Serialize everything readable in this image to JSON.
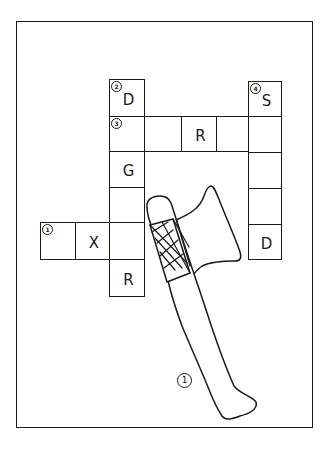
{
  "puzzle": {
    "type": "crossword",
    "clues": [
      {
        "number": "1",
        "direction": "across",
        "length": 3,
        "known_letters": [
          "",
          "X",
          ""
        ],
        "picture_hint": "axe"
      },
      {
        "number": "2",
        "direction": "down",
        "length": 6,
        "known_letters": [
          "D",
          "",
          "G",
          "",
          "",
          "R"
        ]
      },
      {
        "number": "3",
        "direction": "across",
        "length": 5,
        "known_letters": [
          "",
          "",
          "R",
          "",
          ""
        ]
      },
      {
        "number": "4",
        "direction": "down",
        "length": 5,
        "known_letters": [
          "S",
          "",
          "",
          "",
          "D"
        ]
      }
    ],
    "cells": [
      {
        "id": "c-2-1",
        "x": 109,
        "y": 79,
        "w": 36,
        "h": 38,
        "letter": "D",
        "number": "2"
      },
      {
        "id": "c-3-1",
        "x": 109,
        "y": 116,
        "w": 36,
        "h": 36,
        "letter": "",
        "number": "3"
      },
      {
        "id": "c-3-2",
        "x": 144,
        "y": 116,
        "w": 38,
        "h": 36,
        "letter": "",
        "number": ""
      },
      {
        "id": "c-3-3",
        "x": 181,
        "y": 116,
        "w": 36,
        "h": 36,
        "letter": "R",
        "number": ""
      },
      {
        "id": "c-3-4",
        "x": 216,
        "y": 116,
        "w": 33,
        "h": 36,
        "letter": "",
        "number": ""
      },
      {
        "id": "c-4-1",
        "x": 248,
        "y": 81,
        "w": 34,
        "h": 36,
        "letter": "S",
        "number": "4"
      },
      {
        "id": "c-3-5",
        "x": 248,
        "y": 116,
        "w": 34,
        "h": 37,
        "letter": "",
        "number": ""
      },
      {
        "id": "c-4-3",
        "x": 248,
        "y": 152,
        "w": 34,
        "h": 37,
        "letter": "",
        "number": ""
      },
      {
        "id": "c-4-4",
        "x": 248,
        "y": 188,
        "w": 34,
        "h": 37,
        "letter": "",
        "number": ""
      },
      {
        "id": "c-4-5",
        "x": 248,
        "y": 224,
        "w": 34,
        "h": 36,
        "letter": "D",
        "number": ""
      },
      {
        "id": "c-2-3",
        "x": 109,
        "y": 151,
        "w": 36,
        "h": 37,
        "letter": "G",
        "number": ""
      },
      {
        "id": "c-2-4",
        "x": 109,
        "y": 187,
        "w": 36,
        "h": 36,
        "letter": "",
        "number": ""
      },
      {
        "id": "c-1-1",
        "x": 40,
        "y": 222,
        "w": 36,
        "h": 38,
        "letter": "",
        "number": "1"
      },
      {
        "id": "c-1-2",
        "x": 75,
        "y": 222,
        "w": 35,
        "h": 38,
        "letter": "X",
        "number": ""
      },
      {
        "id": "c-1-3",
        "x": 109,
        "y": 222,
        "w": 36,
        "h": 38,
        "letter": "",
        "number": ""
      },
      {
        "id": "c-2-6",
        "x": 109,
        "y": 259,
        "w": 36,
        "h": 38,
        "letter": "R",
        "number": ""
      }
    ],
    "picture_label": "1"
  }
}
